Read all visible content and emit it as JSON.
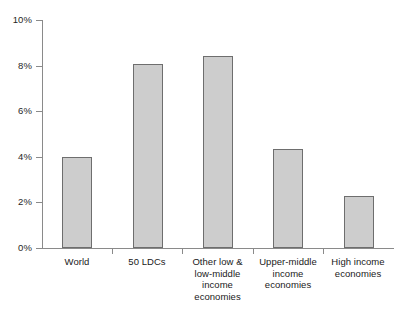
{
  "chart_data": {
    "type": "bar",
    "title": "",
    "subtitle": "",
    "xlabel": "",
    "ylabel": "",
    "ylim": [
      0,
      10
    ],
    "y_unit": "%",
    "grid": false,
    "legend": "none",
    "orientation": "vertical",
    "bar_fill_color": "#cdcdcd",
    "bar_edge_color": "#6e6e6e",
    "axis_color": "#8a8a8a",
    "background_color": "#ffffff",
    "ytick_labels": [
      "0%",
      "2%",
      "4%",
      "6%",
      "8%",
      "10%"
    ],
    "ytick_values": [
      0,
      2,
      4,
      6,
      8,
      10
    ],
    "categories": [
      "World",
      "50 LDCs",
      "Other low & low-middle income economies",
      "Upper-middle income economies",
      "High income economies"
    ],
    "category_label_lines": [
      [
        "World"
      ],
      [
        "50 LDCs"
      ],
      [
        "Other low &",
        "low-middle",
        "income",
        "economies"
      ],
      [
        "Upper-middle",
        "income",
        "economies"
      ],
      [
        "High income",
        "economies"
      ]
    ],
    "values": [
      4.0,
      8.05,
      8.4,
      4.35,
      2.3
    ],
    "value_labels": [
      "4.0%",
      "8.05%",
      "8.4%",
      "4.35%",
      "2.3%"
    ]
  }
}
